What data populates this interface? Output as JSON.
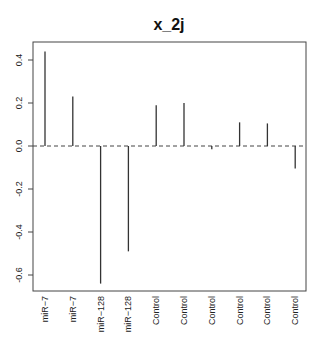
{
  "chart_data": {
    "type": "bar",
    "subtype": "histogram-lines (R type='h')",
    "title": "x_2j",
    "xlabel": "",
    "ylabel": "",
    "categories": [
      "miR−7",
      "miR−7",
      "miR−128",
      "miR−128",
      "Control",
      "Control",
      "Control",
      "Control",
      "Control",
      "Control"
    ],
    "values": [
      0.44,
      0.23,
      -0.64,
      -0.49,
      0.19,
      0.2,
      -0.015,
      0.11,
      0.105,
      -0.105
    ],
    "ylim": [
      -0.68,
      0.48
    ],
    "yticks": [
      -0.6,
      -0.4,
      -0.2,
      0.0,
      0.2,
      0.4
    ],
    "ytick_labels": [
      "-0.6",
      "-0.4",
      "-0.2",
      "0.0",
      "0.2",
      "0.4"
    ],
    "reference_line": {
      "y": 0.0,
      "style": "dashed"
    },
    "grid": false,
    "legend": null,
    "x_labels_rotated": true
  },
  "colors": {
    "line": "#333333",
    "axis": "#444444",
    "text": "#222222",
    "background": "#ffffff"
  }
}
